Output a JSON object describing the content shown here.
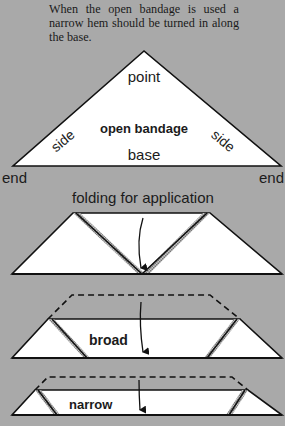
{
  "caption": "When the open bandage is used a narrow hem should be turned in along the base.",
  "open_bandage": {
    "title": "open bandage",
    "labels": {
      "point": "point",
      "side_left": "side",
      "side_right": "side",
      "base": "base",
      "end_left": "end",
      "end_right": "end"
    }
  },
  "folding": {
    "heading": "folding for application",
    "steps": [
      {
        "label": ""
      },
      {
        "label": "broad"
      },
      {
        "label": "narrow"
      }
    ]
  },
  "colors": {
    "background": "#a9a9a9",
    "fill": "#ffffff",
    "stroke": "#111111",
    "shading": "#8a8a8a"
  }
}
